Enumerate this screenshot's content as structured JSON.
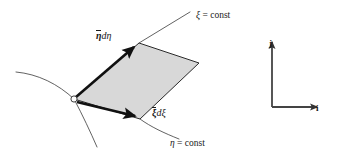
{
  "figure": {
    "background_color": "#ffffff",
    "width": 337,
    "height": 160
  },
  "labels": {
    "xi_const": {
      "symbol": "ξ",
      "equals": " = const"
    },
    "eta_const": {
      "symbol": "η",
      "equals": " = const"
    },
    "eta_vector": {
      "base": "η",
      "differential": "dη"
    },
    "xi_vector": {
      "base": "ξ",
      "differential": "dξ"
    },
    "axis_j": "j",
    "axis_i": "i"
  },
  "colors": {
    "element_fill": "#d8d8d8",
    "element_stroke": "#2a2a2a",
    "curve_stroke": "#3a3a3a",
    "vector_stroke": "#111111",
    "axis_stroke": "#444444",
    "text": "#1a1a1a"
  },
  "geometry": {
    "element_vertices": "74,99 139,43 199,63 140,119",
    "origin_marker": {
      "cx": 74,
      "cy": 99,
      "r": 3.2
    },
    "xi_const_line": {
      "x1": 139,
      "y1": 43,
      "x2": 189,
      "y2": 13
    },
    "eta_const_curve": "M 140,119 C 152,128 165,134 180,139",
    "curve_left_upper": "M 16,72 C 38,74 58,84 74,99",
    "curve_lower_right": "M 74,99 C 83,115 90,130 96,146",
    "eta_vector": {
      "x1": 76,
      "y1": 97,
      "x2": 137,
      "y2": 45
    },
    "xi_vector": {
      "x1": 77,
      "y1": 102,
      "x2": 138,
      "y2": 117
    },
    "axis_corner": {
      "x": 272,
      "y": 107
    },
    "axis_vertical_tip": {
      "x": 272,
      "y": 39
    },
    "axis_horizontal_tip": {
      "x": 320,
      "y": 107
    }
  }
}
